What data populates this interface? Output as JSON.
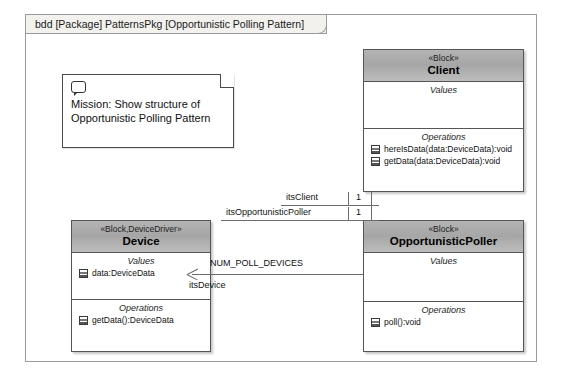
{
  "frame": {
    "label": "bdd [Package] PatternsPkg [Opportunistic Polling Pattern]"
  },
  "note": {
    "icon": "comment-icon",
    "text": "Mission: Show structure of Opportunistic Polling Pattern"
  },
  "blocks": [
    {
      "id": "client",
      "stereotype": "«Block»",
      "name": "Client",
      "values_title": "Values",
      "values": [],
      "operations_title": "Operations",
      "operations": [
        "hereIsData(data:DeviceData):void",
        "getData(data:DeviceData):void"
      ]
    },
    {
      "id": "device",
      "stereotype": "«Block,DeviceDriver»",
      "name": "Device",
      "values_title": "Values",
      "values": [
        "data:DeviceData"
      ],
      "operations_title": "Operations",
      "operations": [
        "getData():DeviceData"
      ]
    },
    {
      "id": "poller",
      "stereotype": "«Block»",
      "name": "OpportunisticPoller",
      "values_title": "Values",
      "values": [],
      "operations_title": "Operations",
      "operations": [
        "poll():void"
      ]
    }
  ],
  "associations": [
    {
      "id": "client-poller",
      "end_a_role": "itsClient",
      "end_a_mult": "1",
      "end_b_role": "itsOpportunisticPoller",
      "end_b_mult": "1"
    },
    {
      "id": "poller-device",
      "multiplicity": "NUM_POLL_DEVICES",
      "role": "itsDevice"
    }
  ],
  "colors": {
    "header_gradient_top": "#b4b4b4",
    "header_gradient_bottom": "#bdbdbd",
    "block_border": "#555555",
    "frame_border": "#9a9a9a",
    "tab_background": "#f2f1ee",
    "line": "#6d6d6d",
    "canvas": "#ffffff"
  }
}
